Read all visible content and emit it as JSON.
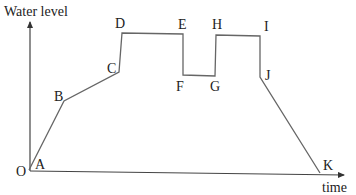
{
  "diagram": {
    "type": "piecewise-linear graph",
    "y_axis_label": "Water level",
    "x_axis_label": "time",
    "origin_label": "O",
    "line_color": "#666666",
    "points": [
      {
        "label": "A",
        "x": 29,
        "y": 170
      },
      {
        "label": "B",
        "x": 64,
        "y": 101
      },
      {
        "label": "C",
        "x": 119,
        "y": 72
      },
      {
        "label": "D",
        "x": 122,
        "y": 33
      },
      {
        "label": "E",
        "x": 183,
        "y": 34
      },
      {
        "label": "F",
        "x": 183,
        "y": 75
      },
      {
        "label": "G",
        "x": 215,
        "y": 76
      },
      {
        "label": "H",
        "x": 216,
        "y": 35
      },
      {
        "label": "I",
        "x": 260,
        "y": 36
      },
      {
        "label": "J",
        "x": 260,
        "y": 77
      },
      {
        "label": "K",
        "x": 320,
        "y": 173
      }
    ]
  }
}
